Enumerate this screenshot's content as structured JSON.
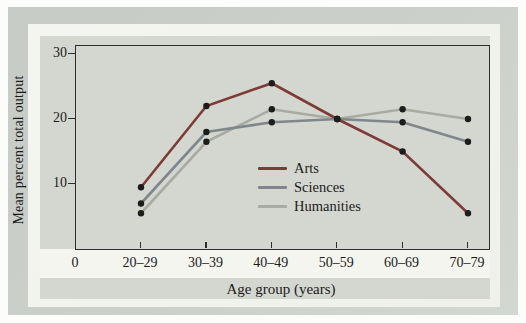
{
  "palette": {
    "page_bg": "#fcfcfa",
    "frame_band": "#c6cbc5",
    "frame_band_light": "#d3d7d1",
    "bevel_bg": "#eef0e9",
    "panel_bg": "#d4d7d0",
    "strip_bg": "#f4f5ef",
    "axis_color": "#2e2e2e",
    "text_color": "#1b1b1b"
  },
  "chart_data": {
    "type": "line",
    "title": "",
    "ylabel": "Mean percent total output",
    "xlabel": "Age group (years)",
    "origin_label": "0",
    "categories": [
      "20–29",
      "30–39",
      "40–49",
      "50–59",
      "60–69",
      "70–79"
    ],
    "yticks": [
      10,
      20,
      30
    ],
    "ylim": [
      0,
      32
    ],
    "grid": false,
    "legend_position": "inside-right-center",
    "point_color": "#1c1c1c",
    "series": [
      {
        "name": "Arts",
        "color": "#7e3b36",
        "values": [
          9.5,
          22,
          25.5,
          20,
          15,
          5.5
        ]
      },
      {
        "name": "Sciences",
        "color": "#7f868e",
        "values": [
          7,
          18,
          19.5,
          20,
          19.5,
          16.5
        ]
      },
      {
        "name": "Humanities",
        "color": "#a9aaa1",
        "values": [
          5.5,
          16.5,
          21.5,
          20,
          21.5,
          20
        ]
      }
    ]
  }
}
